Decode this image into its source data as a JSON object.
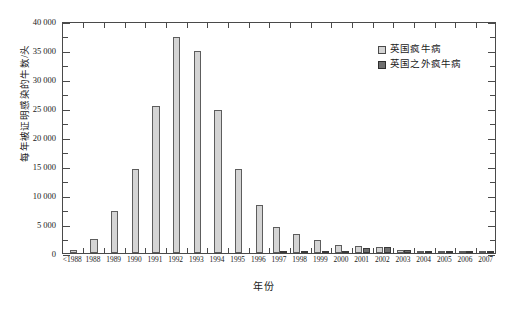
{
  "chart_data": {
    "type": "bar",
    "title": "",
    "xlabel": "年份",
    "ylabel": "每年被证明感染的牛数/头",
    "ylim": [
      0,
      40000
    ],
    "ytick_step": 5000,
    "ytick_labels": [
      "0",
      "5 000",
      "10 000",
      "15 000",
      "20 000",
      "25 000",
      "30 000",
      "35 000",
      "40 000"
    ],
    "ytick_values": [
      0,
      5000,
      10000,
      15000,
      20000,
      25000,
      30000,
      35000,
      40000
    ],
    "grid": false,
    "legend_position": "top-right",
    "categories": [
      "<1988",
      "1988",
      "1989",
      "1990",
      "1991",
      "1992",
      "1993",
      "1994",
      "1995",
      "1996",
      "1997",
      "1998",
      "1999",
      "2000",
      "2001",
      "2002",
      "2003",
      "2004",
      "2005",
      "2006",
      "2007"
    ],
    "series": [
      {
        "name": "英国疯牛病",
        "color": "#d4d4d4",
        "values": [
          450,
          2500,
          7200,
          14400,
          25400,
          37300,
          34900,
          24600,
          14500,
          8200,
          4400,
          3200,
          2300,
          1400,
          1200,
          1100,
          600,
          350,
          220,
          120,
          60
        ]
      },
      {
        "name": "英国之外疯牛病",
        "color": "#6f6f6f",
        "values": [
          0,
          0,
          0,
          0,
          0,
          0,
          0,
          0,
          0,
          0,
          200,
          250,
          300,
          400,
          900,
          1000,
          550,
          330,
          200,
          110,
          50
        ]
      }
    ]
  },
  "legend": {
    "items": [
      {
        "label": "英国疯牛病",
        "swatch": "light-gray-swatch"
      },
      {
        "label": "英国之外疯牛病",
        "swatch": "dark-gray-swatch"
      }
    ]
  }
}
